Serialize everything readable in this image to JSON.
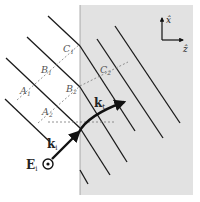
{
  "diagram": {
    "type": "refraction-wavefront",
    "colors": {
      "medium": "#e2e2e2",
      "line": "#1a1a1a",
      "dashed": "#777777",
      "background": "#ffffff"
    },
    "points": {
      "A1": {
        "label": "A",
        "sub": "1"
      },
      "A2": {
        "label": "A",
        "sub": "2"
      },
      "B1": {
        "label": "B",
        "sub": "1"
      },
      "B2": {
        "label": "B",
        "sub": "2"
      },
      "C1": {
        "label": "C",
        "sub": "1"
      },
      "C2": {
        "label": "C",
        "sub": "2"
      }
    },
    "vectors": {
      "ki": {
        "label": "k",
        "sub": "i"
      },
      "kt": {
        "label": "k",
        "sub": "t"
      },
      "Ei": {
        "label": "E",
        "sub": "i"
      }
    },
    "axes": {
      "x": {
        "label": "x̂"
      },
      "z": {
        "label": "ẑ"
      }
    }
  }
}
